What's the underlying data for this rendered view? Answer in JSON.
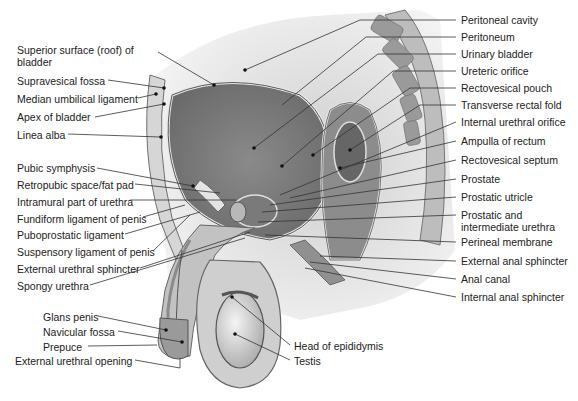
{
  "figure": {
    "left_labels": [
      {
        "id": "superior-surface",
        "text": "Superior surface (roof) of bladder",
        "x": 17,
        "y": 49,
        "multiline": true
      },
      {
        "id": "supravesical-fossa",
        "text": "Supravesical fossa",
        "x": 17,
        "y": 76
      },
      {
        "id": "median-umbilical-ligament",
        "text": "Median umbilical ligament",
        "x": 17,
        "y": 94
      },
      {
        "id": "apex-of-bladder",
        "text": "Apex of bladder",
        "x": 17,
        "y": 112
      },
      {
        "id": "linea-alba",
        "text": "Linea alba",
        "x": 17,
        "y": 131
      },
      {
        "id": "pubic-symphysis",
        "text": "Pubic symphysis",
        "x": 17,
        "y": 164
      },
      {
        "id": "retropubic-space",
        "text": "Retropubic space/fat pad",
        "x": 17,
        "y": 180
      },
      {
        "id": "intramural-urethra",
        "text": "Intramural part of urethra",
        "x": 17,
        "y": 197
      },
      {
        "id": "fundiform-ligament",
        "text": "Fundiform ligament of penis",
        "x": 17,
        "y": 214
      },
      {
        "id": "puboprostatic-ligament",
        "text": "Puboprostatic ligament",
        "x": 17,
        "y": 231
      },
      {
        "id": "suspensory-ligament",
        "text": "Suspensory ligament of penis",
        "x": 17,
        "y": 248
      },
      {
        "id": "external-urethral-sphincter",
        "text": "External urethral sphincter",
        "x": 17,
        "y": 265
      },
      {
        "id": "spongy-urethra",
        "text": "Spongy urethra",
        "x": 17,
        "y": 282
      },
      {
        "id": "glans-penis",
        "text": "Glans penis",
        "x": 43,
        "y": 313
      },
      {
        "id": "navicular-fossa",
        "text": "Navicular fossa",
        "x": 43,
        "y": 328
      },
      {
        "id": "prepuce",
        "text": "Prepuce",
        "x": 43,
        "y": 343
      },
      {
        "id": "external-urethral-opening",
        "text": "External urethral opening",
        "x": 15,
        "y": 357
      }
    ],
    "right_labels": [
      {
        "id": "peritoneal-cavity",
        "text": "Peritoneal cavity",
        "x": 461,
        "y": 15
      },
      {
        "id": "peritoneum",
        "text": "Peritoneum",
        "x": 461,
        "y": 32
      },
      {
        "id": "urinary-bladder",
        "text": "Urinary bladder",
        "x": 461,
        "y": 49
      },
      {
        "id": "ureteric-orifice",
        "text": "Ureteric orifice",
        "x": 461,
        "y": 66
      },
      {
        "id": "rectovesical-pouch",
        "text": "Rectovesical pouch",
        "x": 461,
        "y": 83
      },
      {
        "id": "transverse-rectal-fold",
        "text": "Transverse rectal fold",
        "x": 461,
        "y": 100
      },
      {
        "id": "internal-urethral-orifice",
        "text": "Internal urethral orifice",
        "x": 461,
        "y": 117
      },
      {
        "id": "ampulla-of-rectum",
        "text": "Ampulla of rectum",
        "x": 461,
        "y": 136
      },
      {
        "id": "rectovesical-septum",
        "text": "Rectovesical septum",
        "x": 461,
        "y": 155
      },
      {
        "id": "prostate",
        "text": "Prostate",
        "x": 461,
        "y": 174
      },
      {
        "id": "prostatic-utricle",
        "text": "Prostatic utricle",
        "x": 461,
        "y": 192
      },
      {
        "id": "prostatic-intermediate-urethra",
        "text": "Prostatic and intermediate urethra",
        "x": 461,
        "y": 210,
        "multiline": true
      },
      {
        "id": "perineal-membrane",
        "text": "Perineal membrane",
        "x": 461,
        "y": 237
      },
      {
        "id": "external-anal-sphincter",
        "text": "External anal sphincter",
        "x": 461,
        "y": 256
      },
      {
        "id": "anal-canal",
        "text": "Anal canal",
        "x": 461,
        "y": 274
      },
      {
        "id": "internal-anal-sphincter",
        "text": "Internal anal sphincter",
        "x": 461,
        "y": 292
      }
    ],
    "bottom_labels": [
      {
        "id": "head-of-epididymis",
        "text": "Head of epididymis",
        "x": 294,
        "y": 341
      },
      {
        "id": "testis",
        "text": "Testis",
        "x": 294,
        "y": 356
      }
    ]
  }
}
